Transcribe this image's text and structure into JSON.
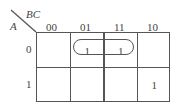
{
  "kmap": {
    "row_var": "A",
    "col_var": "BC",
    "col_labels": [
      "00",
      "01",
      "11",
      "10"
    ],
    "row_labels": [
      "0",
      "1"
    ],
    "cells": [
      [
        "",
        "1",
        "1",
        ""
      ],
      [
        "",
        "",
        "",
        "1"
      ]
    ],
    "groups": [
      {
        "row": 0,
        "cols": [
          "01",
          "11"
        ],
        "shape": "rounded-oval"
      }
    ]
  }
}
